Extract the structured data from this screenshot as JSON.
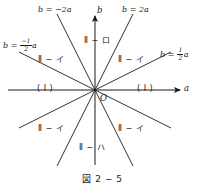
{
  "figure": {
    "caption": "図 2 − 5",
    "axes": {
      "x_label": "a",
      "y_label": "b",
      "origin_label": "O"
    },
    "lines": [
      {
        "id": "b-eq-2a",
        "label_prefix": "b = ",
        "label_body": "2a",
        "slope": 2,
        "label_text": "b = 2a"
      },
      {
        "id": "b-eq-minus-2a",
        "label_prefix": "b = ",
        "label_body": "−2a",
        "slope": -2,
        "label_text": "b = −2a"
      },
      {
        "id": "b-eq-half-a",
        "label_prefix": "b = ",
        "label_num": "1",
        "label_den": "2",
        "label_suffix": "a",
        "slope": 0.5,
        "label_text": "b = 1/2 a"
      },
      {
        "id": "b-eq-minus-half-a",
        "label_prefix": "b = ",
        "label_num": "−1",
        "label_den": "2",
        "label_suffix": "a",
        "slope": -0.5,
        "label_text": "b = −1/2 a"
      }
    ],
    "regions": [
      {
        "id": "region-top",
        "text": "Ⅱ − ロ"
      },
      {
        "id": "region-upper-left",
        "text": "Ⅱ − イ"
      },
      {
        "id": "region-upper-right",
        "text": "Ⅱ − イ"
      },
      {
        "id": "region-left",
        "text": "( Ⅰ )"
      },
      {
        "id": "region-right",
        "text": "( Ⅰ )"
      },
      {
        "id": "region-lower-left",
        "text": "Ⅱ − イ"
      },
      {
        "id": "region-lower-right",
        "text": "Ⅱ − イ"
      },
      {
        "id": "region-bottom",
        "text": "Ⅱ − ハ"
      }
    ],
    "colors": {
      "ink": "#1a1a1a",
      "background": "#ffffff"
    }
  }
}
